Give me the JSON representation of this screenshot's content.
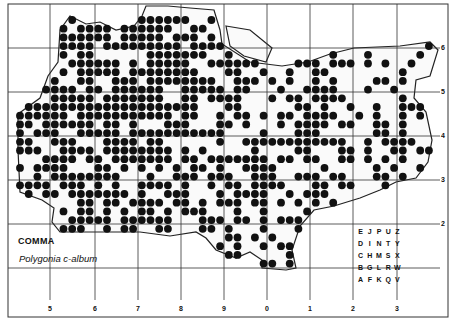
{
  "map": {
    "species_common_name": "COMMA",
    "species_scientific_name": "Polygonia c-album",
    "x_ticks": [
      "5",
      "6",
      "7",
      "8",
      "9",
      "0",
      "1",
      "2",
      "3"
    ],
    "y_ticks": [
      "6",
      "5",
      "4",
      "3",
      "2"
    ],
    "tetrad_key": [
      [
        "E",
        "J",
        "P",
        "U",
        "Z"
      ],
      [
        "D",
        "I",
        "N",
        "T",
        "Y"
      ],
      [
        "C",
        "H",
        "M",
        "S",
        "X"
      ],
      [
        "B",
        "G",
        "L",
        "R",
        "W"
      ],
      [
        "A",
        "F",
        "K",
        "Q",
        "V"
      ]
    ],
    "colors": {
      "dot": "#111111",
      "grid": "#333333",
      "outline": "#222222",
      "background": "#ffffff"
    }
  }
}
